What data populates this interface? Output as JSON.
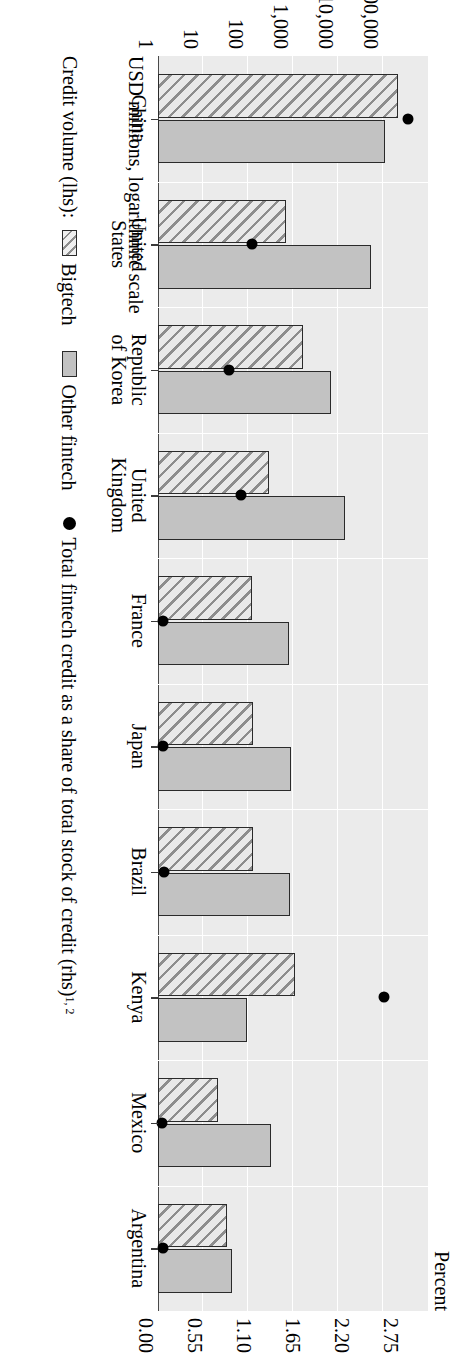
{
  "axes": {
    "left_title": "USD millions, logarithmic scale",
    "right_title": "Percent",
    "left_ticks": [
      "1",
      "10",
      "100",
      "1,000",
      "10,000",
      "100,000"
    ],
    "right_ticks": [
      "0.00",
      "0.55",
      "1.10",
      "1.65",
      "2.20",
      "2.75"
    ]
  },
  "legend": {
    "credit_volume_label": "Credit volume (lhs):",
    "bigtech_label": "Bigtech",
    "other_fintech_label": "Other fintech",
    "dot_label": "Total fintech credit as a share of total stock of credit (rhs)",
    "dot_label_sup": "1, 2"
  },
  "colors": {
    "plot_background": "#ebebeb",
    "gridline": "#ffffff",
    "bar_outline": "#2a2a2a",
    "bigtech_fill": "#e9e9e9",
    "bigtech_hatch": "#8d8d8d",
    "other_fintech_fill": "#c2c2c2",
    "dot": "#000000"
  },
  "chart_data": {
    "type": "bar",
    "title": "",
    "subtitle": "",
    "orientation": "vertical-bars-with-overlay-scatter",
    "xlabel": "",
    "ylabel": "USD millions, logarithmic scale",
    "y2label": "Percent",
    "yscale": "log",
    "ylim": [
      1,
      1000000
    ],
    "yticks": [
      1,
      10,
      100,
      1000,
      10000,
      100000
    ],
    "ytick_labels": [
      "1",
      "10",
      "100",
      "1,000",
      "10,000",
      "100,000"
    ],
    "y2lim": [
      0,
      3.025
    ],
    "y2ticks": [
      0.0,
      0.55,
      1.1,
      1.65,
      2.2,
      2.75
    ],
    "y2tick_labels": [
      "0.00",
      "0.55",
      "1.10",
      "1.65",
      "2.20",
      "2.75"
    ],
    "grid": true,
    "legend_position": "below",
    "categories": [
      "China",
      "United States",
      "Republic of Korea",
      "United Kingdom",
      "France",
      "Japan",
      "Brazil",
      "Kenya",
      "Mexico",
      "Argentina"
    ],
    "category_labels": [
      [
        "China"
      ],
      [
        "United",
        "States"
      ],
      [
        "Republic",
        "of Korea"
      ],
      [
        "United",
        "Kingdom"
      ],
      [
        "France"
      ],
      [
        "Japan"
      ],
      [
        "Brazil"
      ],
      [
        "Kenya"
      ],
      [
        "Mexico"
      ],
      [
        "Argentina"
      ]
    ],
    "series": [
      {
        "name": "Bigtech",
        "axis": "left",
        "style": "hatched",
        "values": [
          215000,
          700,
          1700,
          300,
          120,
          130,
          130,
          1100,
          22,
          35
        ]
      },
      {
        "name": "Other fintech",
        "axis": "left",
        "style": "solid-grey",
        "values": [
          110000,
          55000,
          7000,
          14000,
          800,
          900,
          850,
          95,
          320,
          45
        ]
      },
      {
        "name": "Total fintech credit as a share of total stock of credit (rhs)",
        "axis": "right",
        "style": "dot",
        "values": [
          2.8,
          1.05,
          0.8,
          0.93,
          0.06,
          0.06,
          0.07,
          2.53,
          0.05,
          0.06
        ]
      }
    ]
  }
}
